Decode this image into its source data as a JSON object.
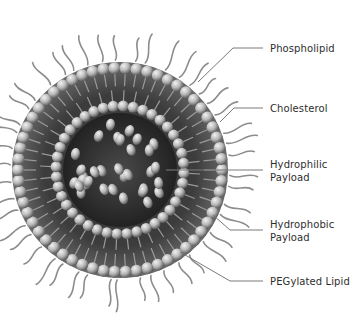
{
  "diagram": {
    "type": "liposome-structure",
    "colors": {
      "background": "#ffffff",
      "label_text": "#2e2e2e",
      "leader_line": "#7a7a7a",
      "head_light": "#d8d8d8",
      "head_dark": "#6e6e6e",
      "tail": "#9a9a9a",
      "core": "#3a3a3a",
      "peg": "#8c8c8c"
    },
    "labels": [
      {
        "id": "phospholipid",
        "lines": [
          "Phospholipid"
        ],
        "y": 42
      },
      {
        "id": "cholesterol",
        "lines": [
          "Cholesterol"
        ],
        "y": 102
      },
      {
        "id": "hydrophilic-payload",
        "lines": [
          "Hydrophilic",
          "Payload"
        ],
        "y": 158
      },
      {
        "id": "hydrophobic-payload",
        "lines": [
          "Hydrophobic",
          "Payload"
        ],
        "y": 218
      },
      {
        "id": "pegylated-lipid",
        "lines": [
          "PEGylated Lipid"
        ],
        "y": 275
      }
    ],
    "leaders": [
      {
        "id": "phospholipid",
        "points": [
          [
            263,
            48
          ],
          [
            233,
            48
          ],
          [
            198,
            82
          ]
        ]
      },
      {
        "id": "cholesterol",
        "points": [
          [
            263,
            108
          ],
          [
            234,
            108
          ],
          [
            220,
            122
          ]
        ]
      },
      {
        "id": "hydrophilic-payload",
        "points": [
          [
            263,
            170
          ],
          [
            166,
            170
          ]
        ]
      },
      {
        "id": "hydrophobic-payload",
        "points": [
          [
            263,
            230
          ],
          [
            230,
            230
          ],
          [
            213,
            215
          ]
        ]
      },
      {
        "id": "pegylated-lipid",
        "points": [
          [
            263,
            281
          ],
          [
            230,
            281
          ],
          [
            180,
            252
          ]
        ]
      }
    ]
  }
}
